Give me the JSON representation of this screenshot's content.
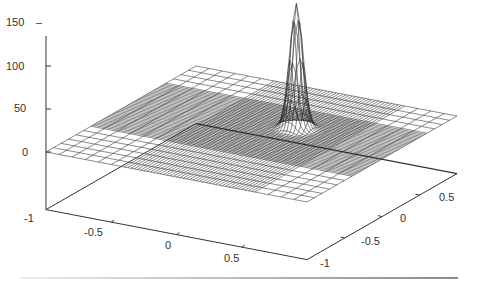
{
  "chart_data": {
    "type": "surface3d",
    "title": "",
    "function": "z = 145 * exp(-((x-0.2)^2 + (y-0.25)^2) / (2*0.045^2))",
    "x_range": [
      -1,
      1
    ],
    "y_range": [
      -1,
      1
    ],
    "z_range": [
      -67,
      150
    ],
    "peak": {
      "x": 0.2,
      "y": 0.25,
      "z": 145
    },
    "grid": {
      "coarse_step": 0.1,
      "dense_region": [
        -0.4,
        0.6
      ],
      "dense_step": 0.025
    },
    "axes": {
      "z_ticks": [
        {
          "value": 150,
          "label": "150"
        },
        {
          "value": 100,
          "label": "100"
        },
        {
          "value": 50,
          "label": "50"
        },
        {
          "value": 0,
          "label": "0"
        }
      ],
      "x_ticks": [
        {
          "value": -1,
          "label": "-1"
        },
        {
          "value": -0.5,
          "label": "-0.5"
        },
        {
          "value": 0,
          "label": "0"
        },
        {
          "value": 0.5,
          "label": "0.5"
        }
      ],
      "y_ticks": [
        {
          "value": -1,
          "label": "-1"
        },
        {
          "value": -0.5,
          "label": "-0.5"
        },
        {
          "value": 0,
          "label": "0"
        },
        {
          "value": 0.5,
          "label": "0.5"
        }
      ]
    },
    "xlabel": "",
    "ylabel": "",
    "zlabel": "",
    "legend": []
  },
  "labels": {
    "z150": "150",
    "z100": "100",
    "z50": "50",
    "z0": "0",
    "zm1": "-1",
    "x_m05": "-0.5",
    "x_0": "0",
    "x_05": "0.5",
    "y_m1": "-1",
    "y_m05": "-0.5",
    "y_0": "0",
    "y_05": "0.5"
  },
  "colors": {
    "mesh": "#2b2b2b",
    "axis": "#333333",
    "background": "#ffffff"
  }
}
